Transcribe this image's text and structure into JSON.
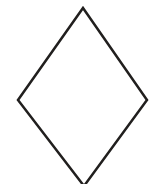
{
  "canvas": {
    "width": 156,
    "height": 184,
    "background_color": "#ffffff",
    "description": "Line drawing of a rhombus outline"
  },
  "figure": {
    "name": "rhombus",
    "shape_type": "rhombus",
    "fill": "none",
    "fill_color": "#ffffff",
    "stroke_color": "#211f1e",
    "stroke_width": 2.5,
    "closed": true,
    "clipped_at_bottom": true,
    "vertices": [
      {
        "label": "top",
        "x": 83,
        "y": 8
      },
      {
        "label": "right",
        "x": 147,
        "y": 100
      },
      {
        "label": "bottom",
        "x": 84,
        "y": 186
      },
      {
        "label": "left",
        "x": 18,
        "y": 100
      }
    ],
    "points_attr": "83,8 147,100 84,186 18,100"
  }
}
